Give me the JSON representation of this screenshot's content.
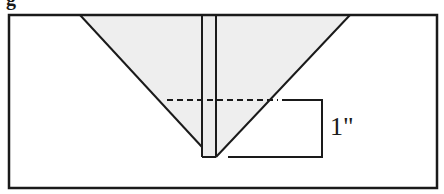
{
  "figure": {
    "header_fragment": "g",
    "dimension_label": "1\"",
    "colors": {
      "stroke": "#1a1a1a",
      "fill": "#eeeeee",
      "background": "#ffffff"
    },
    "elements": [
      {
        "name": "outer-frame",
        "type": "rectangle"
      },
      {
        "name": "inverted-triangle",
        "type": "shaded-polygon"
      },
      {
        "name": "vertical-strip",
        "type": "rectangle"
      },
      {
        "name": "dashed-fold-line",
        "type": "dashed-line"
      },
      {
        "name": "dimension-bracket",
        "type": "bracket",
        "label": "1\""
      }
    ]
  }
}
